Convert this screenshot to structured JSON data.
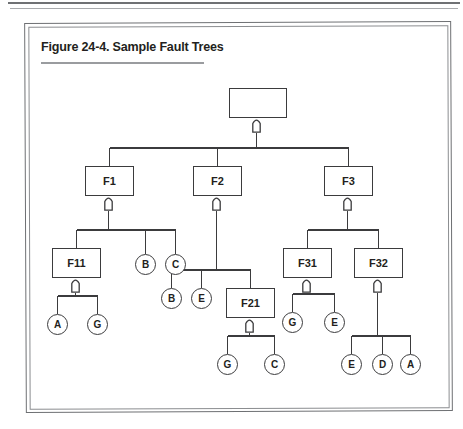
{
  "page": {
    "header_rules": [
      "rule-top",
      "rule-second"
    ]
  },
  "figure": {
    "title": "Figure 24-4. Sample Fault Trees",
    "frame": {
      "outer_border_color": "#6e7073",
      "inner_border_color": "#8b8d90",
      "background": "#ffffff"
    },
    "stroke_color": "#3b3b3d",
    "title_rule_color": "#9a9c9f"
  },
  "diagram": {
    "type": "fault-tree",
    "gate_symbol": "or-gate",
    "nodes": [
      {
        "id": "top",
        "kind": "box",
        "label": "",
        "x": 200,
        "y": 62,
        "w": 58,
        "h": 30
      },
      {
        "id": "f1",
        "kind": "box",
        "label": "F1",
        "x": 56,
        "y": 140,
        "w": 49,
        "h": 30
      },
      {
        "id": "f2",
        "kind": "box",
        "label": "F2",
        "x": 164,
        "y": 140,
        "w": 49,
        "h": 30
      },
      {
        "id": "f3",
        "kind": "box",
        "label": "F3",
        "x": 295,
        "y": 140,
        "w": 49,
        "h": 30
      },
      {
        "id": "f11",
        "kind": "box",
        "label": "F11",
        "x": 23,
        "y": 222,
        "w": 49,
        "h": 30
      },
      {
        "id": "f21",
        "kind": "box",
        "label": "F21",
        "x": 197,
        "y": 262,
        "w": 49,
        "h": 30
      },
      {
        "id": "f31",
        "kind": "box",
        "label": "F31",
        "x": 254,
        "y": 222,
        "w": 49,
        "h": 30
      },
      {
        "id": "f32",
        "kind": "box",
        "label": "F32",
        "x": 325,
        "y": 222,
        "w": 49,
        "h": 30
      },
      {
        "id": "b1",
        "kind": "circle",
        "label": "B",
        "x": 106,
        "y": 228,
        "w": 21,
        "h": 21
      },
      {
        "id": "c1",
        "kind": "circle",
        "label": "C",
        "x": 136,
        "y": 228,
        "w": 21,
        "h": 21
      },
      {
        "id": "a1",
        "kind": "circle",
        "label": "A",
        "x": 18,
        "y": 288,
        "w": 21,
        "h": 21
      },
      {
        "id": "g1",
        "kind": "circle",
        "label": "G",
        "x": 58,
        "y": 288,
        "w": 21,
        "h": 21
      },
      {
        "id": "b2",
        "kind": "circle",
        "label": "B",
        "x": 132,
        "y": 262,
        "w": 21,
        "h": 21
      },
      {
        "id": "e1",
        "kind": "circle",
        "label": "E",
        "x": 162,
        "y": 262,
        "w": 21,
        "h": 21
      },
      {
        "id": "g2",
        "kind": "circle",
        "label": "G",
        "x": 188,
        "y": 328,
        "w": 21,
        "h": 21
      },
      {
        "id": "c2",
        "kind": "circle",
        "label": "C",
        "x": 235,
        "y": 328,
        "w": 21,
        "h": 21
      },
      {
        "id": "g3",
        "kind": "circle",
        "label": "G",
        "x": 253,
        "y": 286,
        "w": 21,
        "h": 21
      },
      {
        "id": "e2",
        "kind": "circle",
        "label": "E",
        "x": 295,
        "y": 286,
        "w": 21,
        "h": 21
      },
      {
        "id": "e3",
        "kind": "circle",
        "label": "E",
        "x": 312,
        "y": 328,
        "w": 21,
        "h": 21
      },
      {
        "id": "d1",
        "kind": "circle",
        "label": "D",
        "x": 343,
        "y": 328,
        "w": 21,
        "h": 21
      },
      {
        "id": "a2",
        "kind": "circle",
        "label": "A",
        "x": 371,
        "y": 328,
        "w": 21,
        "h": 21
      }
    ],
    "gates": [
      {
        "id": "gate-top",
        "parent": "top",
        "x": 223,
        "y": 92
      },
      {
        "id": "gate-f1",
        "parent": "f1",
        "x": 75,
        "y": 170
      },
      {
        "id": "gate-f2",
        "parent": "f2",
        "x": 183,
        "y": 170
      },
      {
        "id": "gate-f3",
        "parent": "f3",
        "x": 314,
        "y": 170
      },
      {
        "id": "gate-f11",
        "parent": "f11",
        "x": 42,
        "y": 252
      },
      {
        "id": "gate-f21",
        "parent": "f21",
        "x": 216,
        "y": 292
      },
      {
        "id": "gate-f31",
        "parent": "f31",
        "x": 273,
        "y": 252
      },
      {
        "id": "gate-f32",
        "parent": "f32",
        "x": 344,
        "y": 252
      }
    ],
    "edges": [
      {
        "from": "top",
        "to": [
          "f1",
          "f2",
          "f3"
        ]
      },
      {
        "from": "f1",
        "to": [
          "f11",
          "b1",
          "c1"
        ]
      },
      {
        "from": "f11",
        "to": [
          "a1",
          "g1"
        ]
      },
      {
        "from": "f2",
        "to": [
          "b2",
          "e1",
          "f21"
        ]
      },
      {
        "from": "f21",
        "to": [
          "g2",
          "c2"
        ]
      },
      {
        "from": "f3",
        "to": [
          "f31",
          "f32"
        ]
      },
      {
        "from": "f31",
        "to": [
          "g3",
          "e2"
        ]
      },
      {
        "from": "f32",
        "to": [
          "e3",
          "d1",
          "a2"
        ]
      }
    ]
  }
}
